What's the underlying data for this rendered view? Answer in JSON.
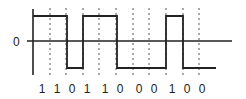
{
  "diagram": {
    "type": "digital-signal-waveform",
    "axis_label_zero": "0",
    "bits": [
      "1",
      "1",
      "0",
      "1",
      "1",
      "0",
      "0",
      "0",
      "1",
      "0",
      "0"
    ],
    "bit_label_x": [
      42,
      57,
      72,
      87,
      105,
      120,
      139,
      154,
      172,
      187,
      202
    ],
    "dashed_x": [
      50,
      66,
      83,
      99,
      116,
      133,
      149,
      166,
      183,
      199
    ],
    "levels": {
      "high_y": 16,
      "zero_y": 41,
      "low_y": 68
    },
    "waveform_points": [
      [
        33,
        16
      ],
      [
        67,
        16
      ],
      [
        67,
        68
      ],
      [
        83,
        68
      ],
      [
        83,
        16
      ],
      [
        117,
        16
      ],
      [
        117,
        68
      ],
      [
        166,
        68
      ],
      [
        166,
        16
      ],
      [
        183,
        16
      ],
      [
        183,
        68
      ],
      [
        216,
        68
      ]
    ],
    "colors": {
      "line": "#222222",
      "dash": "#555555",
      "background": "#ffffff"
    }
  }
}
